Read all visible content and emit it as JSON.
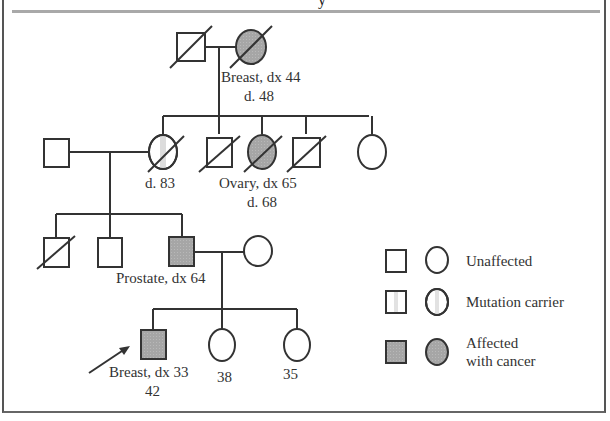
{
  "title": {
    "visible_fragment": "y"
  },
  "colors": {
    "affected_fill": "#a6a6a6",
    "line": "#333333",
    "carrier_stripe": "#dcdcdc",
    "rule": "#a9a9a9"
  },
  "generations": [
    {
      "id": "I",
      "individuals": [
        {
          "id": "I-1",
          "sex": "male",
          "status": "unaffected",
          "deceased": true
        },
        {
          "id": "I-2",
          "sex": "female",
          "status": "affected",
          "deceased": true,
          "label_lines": [
            "Breast, dx 44",
            "d. 48"
          ]
        }
      ]
    },
    {
      "id": "II",
      "individuals": [
        {
          "id": "II-1",
          "sex": "male",
          "status": "unaffected",
          "deceased": false,
          "note": "spouse"
        },
        {
          "id": "II-2",
          "sex": "female",
          "status": "carrier",
          "deceased": true,
          "label_lines": [
            "d. 83"
          ]
        },
        {
          "id": "II-3",
          "sex": "male",
          "status": "unaffected",
          "deceased": true
        },
        {
          "id": "II-4",
          "sex": "female",
          "status": "affected",
          "deceased": true,
          "label_lines": [
            "Ovary, dx 65",
            "d. 68"
          ]
        },
        {
          "id": "II-5",
          "sex": "male",
          "status": "unaffected",
          "deceased": true
        },
        {
          "id": "II-6",
          "sex": "female",
          "status": "unaffected",
          "deceased": false
        }
      ]
    },
    {
      "id": "III",
      "individuals": [
        {
          "id": "III-1",
          "sex": "male",
          "status": "unaffected",
          "deceased": true
        },
        {
          "id": "III-2",
          "sex": "male",
          "status": "unaffected",
          "deceased": false
        },
        {
          "id": "III-3",
          "sex": "male",
          "status": "affected",
          "deceased": false,
          "label_lines": [
            "Prostate, dx 64"
          ]
        },
        {
          "id": "III-4",
          "sex": "female",
          "status": "unaffected",
          "deceased": false,
          "note": "spouse"
        }
      ]
    },
    {
      "id": "IV",
      "individuals": [
        {
          "id": "IV-1",
          "sex": "male",
          "status": "affected",
          "deceased": false,
          "proband": true,
          "label_lines": [
            "Breast, dx 33",
            "42"
          ]
        },
        {
          "id": "IV-2",
          "sex": "female",
          "status": "unaffected",
          "deceased": false,
          "label_lines": [
            "38"
          ]
        },
        {
          "id": "IV-3",
          "sex": "female",
          "status": "unaffected",
          "deceased": false,
          "label_lines": [
            "35"
          ]
        }
      ]
    }
  ],
  "labels": {
    "i2_line1": "Breast, dx 44",
    "i2_line2": "d. 48",
    "ii2": "d. 83",
    "ii4_line1": "Ovary, dx 65",
    "ii4_line2": "d. 68",
    "iii3": "Prostate, dx 64",
    "iv1_line1": "Breast, dx 33",
    "iv1_line2": "42",
    "iv2": "38",
    "iv3": "35"
  },
  "legend": {
    "items": [
      {
        "label": "Unaffected",
        "icon": "unaffected-symbols"
      },
      {
        "label": "Mutation carrier",
        "icon": "carrier-symbols"
      },
      {
        "label_line1": "Affected",
        "label_line2": "with cancer",
        "icon": "affected-symbols"
      }
    ],
    "unaffected": "Unaffected",
    "carrier": "Mutation carrier",
    "affected_line1": "Affected",
    "affected_line2": "with cancer"
  }
}
